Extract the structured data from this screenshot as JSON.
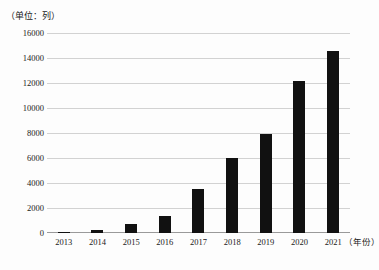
{
  "chart_data": {
    "type": "bar",
    "title": "",
    "unit_caption": "（单位：列）",
    "xlabel": "（年份）",
    "ylabel": "",
    "categories": [
      "2013",
      "2014",
      "2015",
      "2016",
      "2017",
      "2018",
      "2019",
      "2020",
      "2021"
    ],
    "values": [
      50,
      250,
      700,
      1400,
      3500,
      6000,
      7900,
      12200,
      14600
    ],
    "ylim": [
      0,
      16000
    ],
    "ytick_labels": [
      "0",
      "2000",
      "4000",
      "6000",
      "8000",
      "10000",
      "12000",
      "14000",
      "16000"
    ],
    "ytick_values": [
      0,
      2000,
      4000,
      6000,
      8000,
      10000,
      12000,
      14000,
      16000
    ],
    "grid": true,
    "legend": "none",
    "bar_color": "#111111",
    "grid_color": "#d2d2d2",
    "axis_color": "#9a9a9a"
  }
}
